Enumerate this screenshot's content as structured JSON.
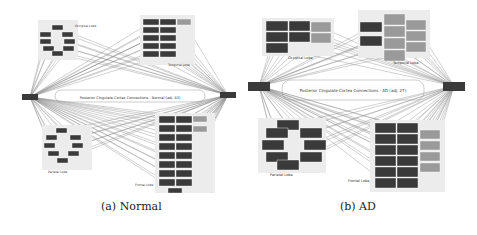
{
  "colors": {
    "node_dark": "#3a3a3a",
    "node_grey": "#9a9a9a",
    "lobe_bg": "#ececec",
    "edge": "#8a8a8a",
    "text": "#333333"
  },
  "panels": [
    {
      "id": "a",
      "caption": "(a)  Normal",
      "center_label": "Posterior Cingulate Cortex Connections - Normal (adj. 63)",
      "lobes": [
        {
          "name": "Occipital Lobe"
        },
        {
          "name": "Temporal Lobe"
        },
        {
          "name": "Parietal Lobe"
        },
        {
          "name": "Frontal Lobe"
        }
      ]
    },
    {
      "id": "b",
      "caption": "(b)  AD",
      "center_label": "Posterior Cingulate Cortex Connections - AD (adj. 27)",
      "lobes": [
        {
          "name": "Occipital Lobe"
        },
        {
          "name": "Temporal Lobe"
        },
        {
          "name": "Parietal Lobe"
        },
        {
          "name": "Frontal Lobe"
        }
      ]
    }
  ]
}
